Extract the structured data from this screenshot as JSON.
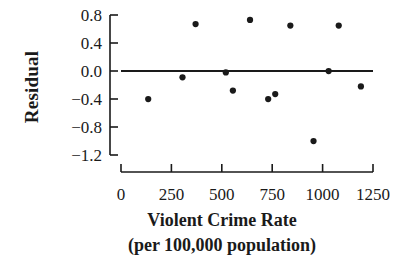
{
  "chart_data": {
    "type": "scatter",
    "title": "",
    "xlabel": "Violent Crime Rate",
    "xlabel_line2": "(per 100,000 population)",
    "ylabel": "Residual",
    "xlim": [
      0,
      1250
    ],
    "ylim": [
      -1.3,
      0.9
    ],
    "xticks": [
      0,
      250,
      500,
      750,
      1000,
      1250
    ],
    "xticklabels": [
      "0",
      "250",
      "500",
      "750",
      "1000",
      "1250"
    ],
    "yticks": [
      0.8,
      0.4,
      0.0,
      -0.4,
      -0.8,
      -1.2
    ],
    "yticklabels": [
      "0.8",
      "0.4",
      "0.0",
      "−0.4",
      "−0.8",
      "−1.2"
    ],
    "grid": false,
    "legend": null,
    "reference_line": {
      "type": "horizontal",
      "y": 0.0,
      "x_start": 0,
      "x_end": 1250
    },
    "marker": {
      "shape": "circle",
      "size": 5,
      "color": "#1a1a1a"
    },
    "points": [
      {
        "x": 135,
        "y": -0.4
      },
      {
        "x": 305,
        "y": -0.09
      },
      {
        "x": 370,
        "y": 0.67
      },
      {
        "x": 520,
        "y": -0.02
      },
      {
        "x": 555,
        "y": -0.28
      },
      {
        "x": 640,
        "y": 0.73
      },
      {
        "x": 730,
        "y": -0.4
      },
      {
        "x": 765,
        "y": -0.33
      },
      {
        "x": 840,
        "y": 0.65
      },
      {
        "x": 955,
        "y": -1.0
      },
      {
        "x": 1030,
        "y": 0.0
      },
      {
        "x": 1080,
        "y": 0.65
      },
      {
        "x": 1190,
        "y": -0.22
      }
    ],
    "colors": {
      "foreground": "#1a1a1a",
      "background": "#ffffff"
    }
  }
}
